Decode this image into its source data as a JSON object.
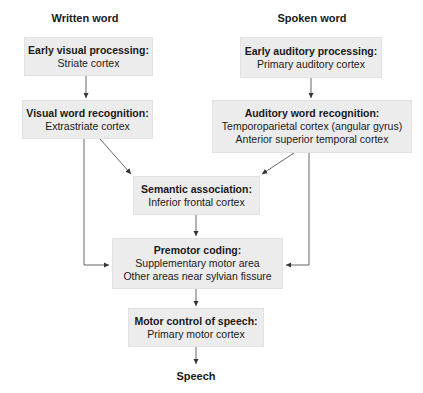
{
  "columns": {
    "written": "Written word",
    "spoken": "Spoken word"
  },
  "boxes": {
    "early_visual": {
      "title": "Early visual processing:",
      "lines": [
        "Striate cortex"
      ]
    },
    "visual_word": {
      "title": "Visual word recognition:",
      "lines": [
        "Extrastriate cortex"
      ]
    },
    "early_auditory": {
      "title": "Early auditory processing:",
      "lines": [
        "Primary auditory cortex"
      ]
    },
    "auditory_word": {
      "title": "Auditory word recognition:",
      "lines": [
        "Temporoparietal cortex (angular gyrus)",
        "Anterior superior temporal cortex"
      ]
    },
    "semantic": {
      "title": "Semantic association:",
      "lines": [
        "Inferior frontal cortex"
      ]
    },
    "premotor": {
      "title": "Premotor coding:",
      "lines": [
        "Supplementary motor area",
        "Other areas near sylvian fissure"
      ]
    },
    "motor": {
      "title": "Motor control of speech:",
      "lines": [
        "Primary motor cortex"
      ]
    }
  },
  "output_label": "Speech",
  "colors": {
    "box_fill": "#ececec",
    "line": "#555555",
    "text": "#1a1a1a"
  }
}
